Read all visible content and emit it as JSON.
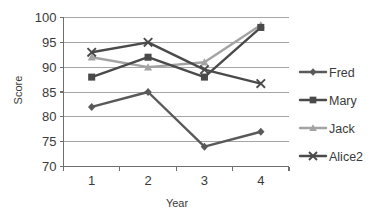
{
  "chart_data": {
    "type": "line",
    "title": "",
    "xlabel": "Year",
    "ylabel": "Score",
    "x": [
      1,
      2,
      3,
      4
    ],
    "categories": [
      "1",
      "2",
      "3",
      "4"
    ],
    "xtick_labels": [
      "1",
      "2",
      "3",
      "4"
    ],
    "ytick_labels": [
      "70",
      "75",
      "80",
      "85",
      "90",
      "95",
      "100"
    ],
    "yticks": [
      70,
      75,
      80,
      85,
      90,
      95,
      100
    ],
    "ylim": [
      70,
      100
    ],
    "xlim": [
      0.5,
      4.5
    ],
    "grid": "horizontal",
    "legend_position": "right",
    "series": [
      {
        "name": "Fred",
        "values": [
          82,
          85,
          74,
          77
        ],
        "color": "#595959",
        "marker": "diamond"
      },
      {
        "name": "Mary",
        "values": [
          88,
          92,
          88,
          98
        ],
        "color": "#4a4a4a",
        "marker": "square"
      },
      {
        "name": "Jack",
        "values": [
          92,
          90,
          91,
          98.5
        ],
        "color": "#a3a3a3",
        "marker": "triangle"
      },
      {
        "name": "Alice2",
        "values": [
          93,
          95,
          89.5,
          86.7
        ],
        "color": "#4a4a4a",
        "marker": "x"
      }
    ]
  },
  "legend": {
    "items": [
      {
        "label": "Fred"
      },
      {
        "label": "Mary"
      },
      {
        "label": "Jack"
      },
      {
        "label": "Alice2"
      }
    ]
  },
  "axes": {
    "y_title": "Score",
    "x_title": "Year"
  }
}
